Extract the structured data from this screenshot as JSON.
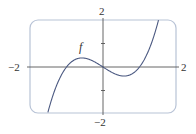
{
  "chart_data": {
    "type": "line",
    "title": "",
    "xlabel": "",
    "ylabel": "",
    "xlim": [
      -2,
      2
    ],
    "ylim": [
      -2,
      2
    ],
    "grid": false,
    "legend": null,
    "tick_labels": {
      "x_left": "−2",
      "x_right": "2",
      "y_top": "2",
      "y_bottom": "−2"
    },
    "y_minor_ticks": [
      1,
      -1
    ],
    "annotations": [
      {
        "text": "f",
        "x": -0.55,
        "y": 0.85
      }
    ],
    "series": [
      {
        "name": "f",
        "expression": "x^3 - x",
        "x": [
          -1.55,
          -1.4,
          -1.2,
          -1.0,
          -0.8,
          -0.577,
          -0.4,
          -0.2,
          0,
          0.2,
          0.4,
          0.577,
          0.8,
          1.0,
          1.2,
          1.4,
          1.55
        ],
        "y": [
          -2.17,
          -1.34,
          -0.53,
          0,
          0.29,
          0.385,
          0.34,
          0.19,
          0,
          -0.19,
          -0.34,
          -0.385,
          -0.29,
          0,
          0.53,
          1.34,
          2.17
        ]
      }
    ],
    "colors": {
      "frame": "#b8c3d6",
      "curve": "#4a5880",
      "axes": "#555555"
    }
  }
}
